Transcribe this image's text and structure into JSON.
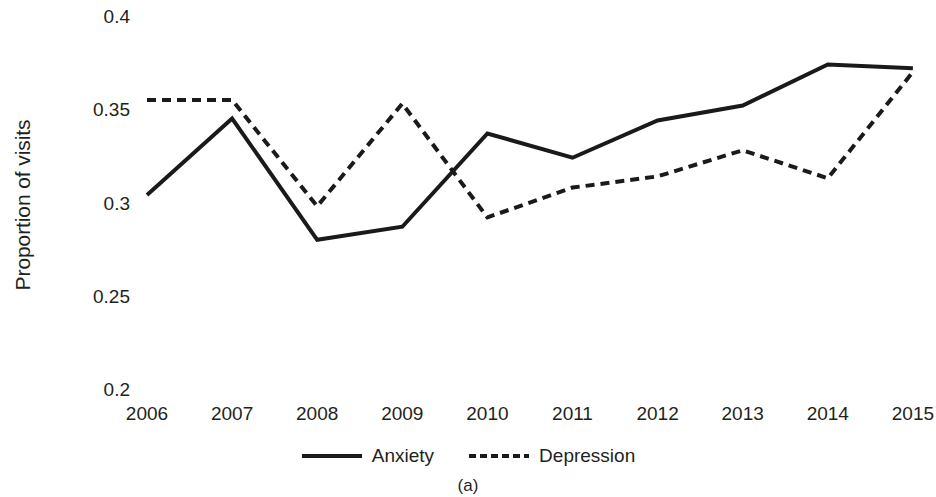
{
  "chart_data": {
    "type": "line",
    "title": "",
    "subtitle": "",
    "caption": "(a)",
    "xlabel": "",
    "ylabel": "Proportion of visits",
    "categories": [
      "2006",
      "2007",
      "2008",
      "2009",
      "2010",
      "2011",
      "2012",
      "2013",
      "2014",
      "2015"
    ],
    "x": [
      2006,
      2007,
      2008,
      2009,
      2010,
      2011,
      2012,
      2013,
      2014,
      2015
    ],
    "xtick_labels": [
      "2006",
      "2007",
      "2008",
      "2009",
      "2010",
      "2011",
      "2012",
      "2013",
      "2014",
      "2015"
    ],
    "ytick_labels": [
      "0.4",
      "0.35",
      "0.3",
      "0.25",
      "0.2"
    ],
    "ytick_values": [
      0.4,
      0.35,
      0.3,
      0.25,
      0.2
    ],
    "ylim": [
      0.2,
      0.4
    ],
    "grid": false,
    "legend_position": "bottom",
    "series": [
      {
        "name": "Anxiety",
        "style": "solid",
        "color": "#1a1a1a",
        "values": [
          0.304,
          0.345,
          0.28,
          0.287,
          0.337,
          0.324,
          0.344,
          0.352,
          0.374,
          0.372
        ]
      },
      {
        "name": "Depression",
        "style": "dashed",
        "color": "#1a1a1a",
        "values": [
          0.355,
          0.355,
          0.298,
          0.353,
          0.292,
          0.308,
          0.314,
          0.328,
          0.313,
          0.37
        ]
      }
    ]
  },
  "colors": {
    "line": "#1a1a1a",
    "text": "#231f20",
    "background": "#ffffff"
  }
}
